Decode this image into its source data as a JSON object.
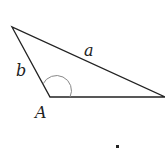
{
  "diagram": {
    "type": "triangle",
    "labels": {
      "side_a": "a",
      "side_b": "b",
      "angle_A": "A"
    },
    "vertices": {
      "top": [
        12,
        27
      ],
      "A": [
        50,
        97
      ],
      "right": [
        165,
        97
      ]
    },
    "colors": {
      "stroke": "#222222",
      "angle_arc": "#888888"
    }
  },
  "footer_mark": "."
}
